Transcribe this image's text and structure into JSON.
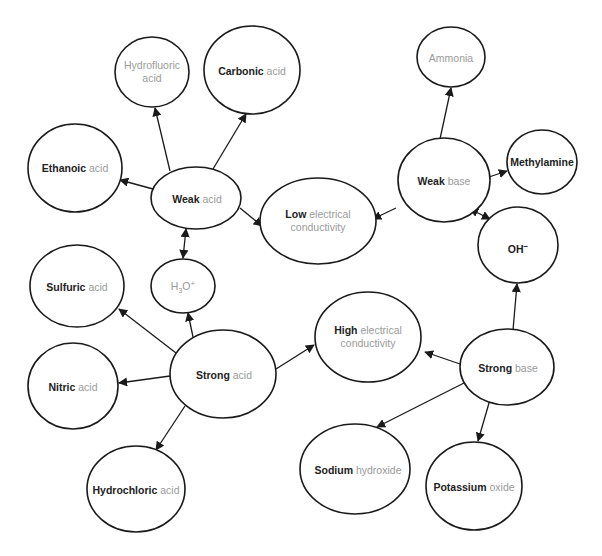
{
  "diagram": {
    "colors": {
      "stroke": "#1a1a1a",
      "bold_text": "#222222",
      "light_text": "#9a9a9a",
      "background": "#ffffff"
    },
    "nodes": {
      "hydrofluoric_acid": {
        "bold": "",
        "rest": "Hydrofluoric",
        "rest2": "acid"
      },
      "carbonic_acid": {
        "bold": "Carbonic",
        "rest": "acid"
      },
      "ethanoic_acid": {
        "bold": "Ethanoic",
        "rest": "acid"
      },
      "weak_acid": {
        "bold": "Weak",
        "rest": "acid"
      },
      "low_conductivity": {
        "bold": "Low",
        "rest": "electrical",
        "rest2": "conductivity"
      },
      "ammonia": {
        "bold": "",
        "rest": "Ammonia"
      },
      "weak_base": {
        "bold": "Weak",
        "rest": "base"
      },
      "methylamine": {
        "bold": "Methylamine",
        "rest": ""
      },
      "hydroxide_ion": {
        "bold": "OH",
        "sup": "−"
      },
      "hydronium_ion": {
        "rest": "H",
        "sub": "3",
        "rest_after": "O",
        "sup": "+"
      },
      "sulfuric_acid": {
        "bold": "Sulfuric",
        "rest": "acid"
      },
      "nitric_acid": {
        "bold": "Nitric",
        "rest": "acid"
      },
      "strong_acid": {
        "bold": "Strong",
        "rest": "acid"
      },
      "high_conductivity": {
        "bold": "High",
        "rest": "electrical",
        "rest2": "conductivity"
      },
      "strong_base": {
        "bold": "Strong",
        "rest": "base"
      },
      "sodium_hydroxide": {
        "bold": "Sodium",
        "rest": "hydroxide"
      },
      "potassium_oxide": {
        "bold": "Potassium",
        "rest": "oxide"
      },
      "hydrochloric_acid": {
        "bold": "Hydrochloric",
        "rest": "acid"
      }
    },
    "edges": [
      {
        "from": "weak_acid",
        "to": "hydrofluoric_acid",
        "type": "single"
      },
      {
        "from": "weak_acid",
        "to": "carbonic_acid",
        "type": "single"
      },
      {
        "from": "weak_acid",
        "to": "ethanoic_acid",
        "type": "single"
      },
      {
        "from": "weak_acid",
        "to": "low_conductivity",
        "type": "single"
      },
      {
        "from": "weak_acid",
        "to": "hydronium_ion",
        "type": "double"
      },
      {
        "from": "weak_base",
        "to": "ammonia",
        "type": "single"
      },
      {
        "from": "weak_base",
        "to": "methylamine",
        "type": "single"
      },
      {
        "from": "weak_base",
        "to": "low_conductivity",
        "type": "single"
      },
      {
        "from": "weak_base",
        "to": "hydroxide_ion",
        "type": "double"
      },
      {
        "from": "strong_acid",
        "to": "hydronium_ion",
        "type": "single"
      },
      {
        "from": "strong_acid",
        "to": "sulfuric_acid",
        "type": "single"
      },
      {
        "from": "strong_acid",
        "to": "nitric_acid",
        "type": "single"
      },
      {
        "from": "strong_acid",
        "to": "hydrochloric_acid",
        "type": "single"
      },
      {
        "from": "strong_acid",
        "to": "high_conductivity",
        "type": "single"
      },
      {
        "from": "strong_base",
        "to": "hydroxide_ion",
        "type": "single"
      },
      {
        "from": "strong_base",
        "to": "high_conductivity",
        "type": "single"
      },
      {
        "from": "strong_base",
        "to": "sodium_hydroxide",
        "type": "single"
      },
      {
        "from": "strong_base",
        "to": "potassium_oxide",
        "type": "single"
      }
    ]
  }
}
